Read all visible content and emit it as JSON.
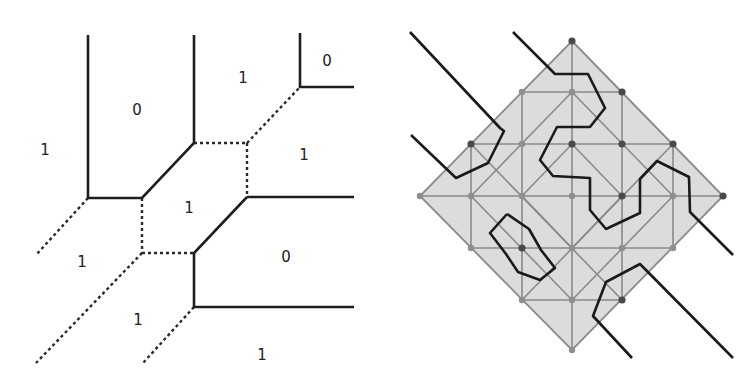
{
  "left_diagram": {
    "title": "tropical curve region labels",
    "labels": [
      {
        "text": "1",
        "x": 45,
        "y": 150
      },
      {
        "text": "0",
        "x": 137,
        "y": 110
      },
      {
        "text": "1",
        "x": 243,
        "y": 78
      },
      {
        "text": "0",
        "x": 327,
        "y": 61
      },
      {
        "text": "1",
        "x": 304,
        "y": 155
      },
      {
        "text": "1",
        "x": 189,
        "y": 208
      },
      {
        "text": "1",
        "x": 82,
        "y": 262
      },
      {
        "text": "0",
        "x": 286,
        "y": 257
      },
      {
        "text": "1",
        "x": 138,
        "y": 320
      },
      {
        "text": "1",
        "x": 262,
        "y": 355
      }
    ],
    "solid_edges": [
      [
        [
          88,
          35
        ],
        [
          88,
          198
        ],
        [
          142,
          198
        ],
        [
          194,
          143
        ],
        [
          194,
          35
        ]
      ],
      [
        [
          300,
          33
        ],
        [
          300,
          87
        ],
        [
          354,
          87
        ]
      ],
      [
        [
          247,
          197
        ],
        [
          354,
          197
        ]
      ],
      [
        [
          247,
          197
        ],
        [
          194,
          253
        ],
        [
          194,
          307
        ],
        [
          354,
          307
        ]
      ]
    ],
    "dotted_edges": [
      [
        [
          194,
          143
        ],
        [
          247,
          143
        ]
      ],
      [
        [
          247,
          143
        ],
        [
          247,
          197
        ]
      ],
      [
        [
          247,
          143
        ],
        [
          300,
          87
        ]
      ],
      [
        [
          142,
          198
        ],
        [
          142,
          253
        ]
      ],
      [
        [
          142,
          253
        ],
        [
          194,
          253
        ]
      ],
      [
        [
          88,
          198
        ],
        [
          36,
          255
        ]
      ],
      [
        [
          142,
          253
        ],
        [
          36,
          363
        ]
      ],
      [
        [
          194,
          307
        ],
        [
          143,
          363
        ]
      ]
    ]
  },
  "right_diagram": {
    "fill_color": "#dcdcdc",
    "grid_color": "#8a8a8a",
    "diamond": [
      [
        572,
        41
      ],
      [
        723,
        196
      ],
      [
        572,
        350
      ],
      [
        420,
        196
      ]
    ],
    "dark_points": [
      [
        572,
        41
      ],
      [
        622,
        92
      ],
      [
        471,
        144
      ],
      [
        572,
        144
      ],
      [
        622,
        144
      ],
      [
        673,
        144
      ],
      [
        622,
        196
      ],
      [
        723,
        196
      ],
      [
        522,
        248
      ],
      [
        622,
        300
      ]
    ],
    "light_points": [
      [
        522,
        92
      ],
      [
        572,
        92
      ],
      [
        522,
        144
      ],
      [
        420,
        196
      ],
      [
        471,
        196
      ],
      [
        522,
        196
      ],
      [
        572,
        196
      ],
      [
        673,
        196
      ],
      [
        471,
        248
      ],
      [
        572,
        248
      ],
      [
        622,
        248
      ],
      [
        673,
        248
      ],
      [
        522,
        300
      ],
      [
        572,
        300
      ],
      [
        572,
        350
      ]
    ],
    "curves": [
      [
        [
          410,
          32
        ],
        [
          500,
          128
        ],
        [
          504,
          131
        ],
        [
          488,
          163
        ],
        [
          456,
          178
        ],
        [
          411,
          135
        ]
      ],
      [
        [
          513,
          32
        ],
        [
          555,
          74
        ],
        [
          588,
          74
        ],
        [
          605,
          108
        ],
        [
          590,
          127
        ],
        [
          557,
          127
        ],
        [
          540,
          160
        ],
        [
          553,
          176
        ],
        [
          590,
          178
        ],
        [
          590,
          210
        ],
        [
          606,
          229
        ],
        [
          640,
          213
        ],
        [
          640,
          179
        ],
        [
          657,
          161
        ],
        [
          689,
          177
        ],
        [
          690,
          212
        ],
        [
          733,
          255
        ]
      ],
      [
        [
          507,
          214
        ],
        [
          529,
          229
        ],
        [
          541,
          250
        ],
        [
          555,
          268
        ],
        [
          540,
          280
        ],
        [
          518,
          272
        ],
        [
          506,
          254
        ],
        [
          490,
          233
        ],
        [
          507,
          214
        ]
      ],
      [
        [
          632,
          358
        ],
        [
          593,
          316
        ],
        [
          606,
          282
        ],
        [
          640,
          264
        ],
        [
          733,
          358
        ]
      ]
    ]
  }
}
